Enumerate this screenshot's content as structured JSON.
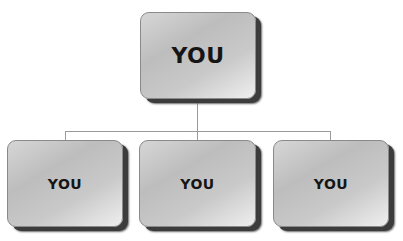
{
  "diagram": {
    "type": "org-chart",
    "root": {
      "label": "YOU"
    },
    "children": [
      {
        "label": "YOU"
      },
      {
        "label": "YOU"
      },
      {
        "label": "YOU"
      }
    ]
  },
  "colors": {
    "box_fill_light": "#efefef",
    "box_fill_dark": "#bdbdbd",
    "box_shadow": "#3c3c3c",
    "connector": "#9a9a9a",
    "text": "#151515"
  }
}
